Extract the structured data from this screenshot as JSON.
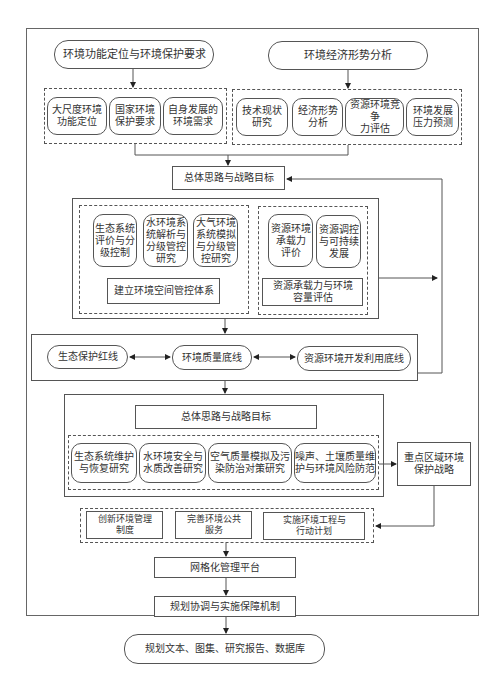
{
  "diagram": {
    "top_left_header": "环境功能定位与环境保护要求",
    "top_right_header": "环境经济形势分析",
    "left_group": [
      "大尺度环境\n功能定位",
      "国家环境\n保护要求",
      "自身发展的\n环境需求"
    ],
    "right_group": [
      "技术现状\n研究",
      "经济形势\n分析",
      "资源环境竞争\n力评估",
      "环境发展\n压力预测"
    ],
    "strategy_1": "总体思路与战略目标",
    "spatial_group": [
      "生态系统\n评价与分\n级控制",
      "水环境系\n统解析与\n分级管控\n研究",
      "大气环境\n系统模拟\n与分级管\n控研究"
    ],
    "spatial_system": "建立环境空间管控体系",
    "capacity_group": [
      "资源环境\n承载力\n评价",
      "资源调控\n与可持续\n发展"
    ],
    "capacity_eval": "资源承载力与环境\n容量评估",
    "redlines": [
      "生态保护红线",
      "环境质量底线",
      "资源环境开发利用底线"
    ],
    "strategy_2": "总体思路与战略目标",
    "research_group": [
      "生态系统维护\n与恢复研究",
      "水环境安全与\n水质改善研究",
      "空气质量模拟及污\n染防治对策研究",
      "噪声、土壤质量维\n护与环境风险防范"
    ],
    "key_region": "重点区域环境\n保护战略",
    "measures": [
      "创新环境管理\n制度",
      "完善环境公共\n服务",
      "实施环境工程与\n行动计划"
    ],
    "grid_platform": "网格化管理平台",
    "mechanism": "规划协调与实施保障机制",
    "outputs": "规划文本、图集、研究报告、数据库"
  }
}
